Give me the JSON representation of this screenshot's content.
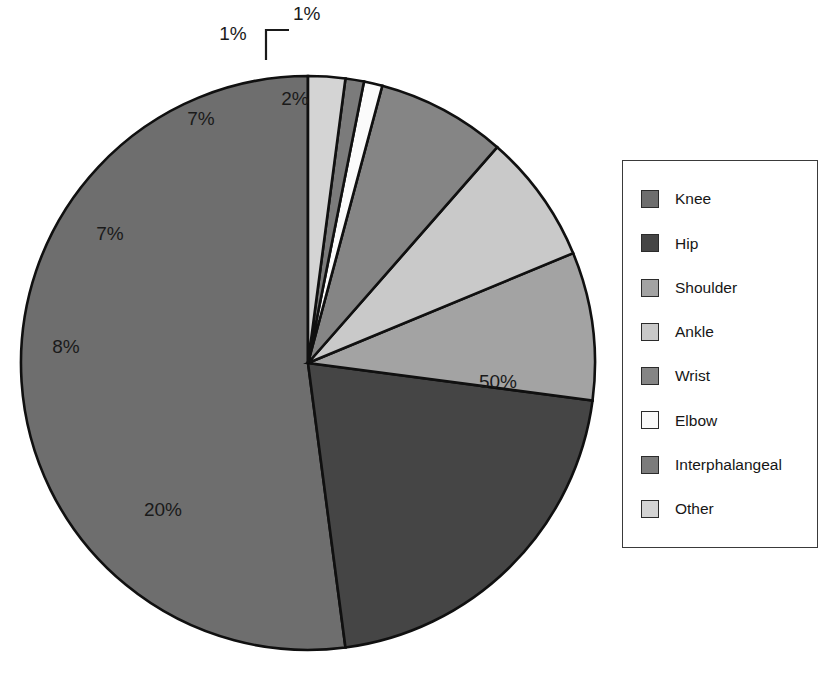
{
  "chart_data": {
    "type": "pie",
    "title": "",
    "subtitle": "",
    "xlabel": "",
    "ylabel": "",
    "grid": false,
    "legend_position": "right",
    "value_unit": "%",
    "categories": [
      "Knee",
      "Hip",
      "Shoulder",
      "Ankle",
      "Wrist",
      "Elbow",
      "Interphalangeal",
      "Other"
    ],
    "values": [
      50,
      20,
      8,
      7,
      7,
      1,
      1,
      2
    ],
    "labels": [
      "50%",
      "20%",
      "8%",
      "7%",
      "7%",
      "1%",
      "1%",
      "2%"
    ],
    "colors": [
      "#6e6e6e",
      "#454545",
      "#a3a3a3",
      "#c9c9c9",
      "#858585",
      "#fbfbfb",
      "#7b7b7b",
      "#d4d4d4"
    ],
    "slices": [
      {
        "name": "Knee",
        "value": 50,
        "label": "50%",
        "color": "#6e6e6e",
        "label_color": "#ffffff",
        "label_x": 498,
        "label_y": 388,
        "label_anchor": "middle"
      },
      {
        "name": "Hip",
        "value": 20,
        "label": "20%",
        "color": "#454545",
        "label_color": "#ffffff",
        "label_x": 163,
        "label_y": 516,
        "label_anchor": "middle"
      },
      {
        "name": "Shoulder",
        "value": 8,
        "label": "8%",
        "color": "#a3a3a3",
        "label_color": "#1a1a1a",
        "label_x": 66,
        "label_y": 353,
        "label_anchor": "middle"
      },
      {
        "name": "Ankle",
        "value": 7,
        "label": "7%",
        "color": "#c9c9c9",
        "label_color": "#1a1a1a",
        "label_x": 110,
        "label_y": 240,
        "label_anchor": "middle"
      },
      {
        "name": "Wrist",
        "value": 7,
        "label": "7%",
        "color": "#858585",
        "label_color": "#1a1a1a",
        "label_x": 201,
        "label_y": 125,
        "label_anchor": "middle"
      },
      {
        "name": "Elbow",
        "value": 1,
        "label": "1%",
        "color": "#fbfbfb",
        "label_color": "#1a1a1a",
        "label_x": 233,
        "label_y": 40,
        "label_anchor": "middle"
      },
      {
        "name": "Interphalangeal",
        "value": 1,
        "label": "1%",
        "color": "#7b7b7b",
        "label_color": "#1a1a1a",
        "label_x": 293,
        "label_y": 20,
        "label_anchor": "start"
      },
      {
        "name": "Other",
        "value": 2,
        "label": "2%",
        "color": "#d4d4d4",
        "label_color": "#1a1a1a",
        "label_x": 295,
        "label_y": 105,
        "label_anchor": "middle"
      }
    ],
    "geometry": {
      "center_x": 308,
      "center_y": 363,
      "radius": 287,
      "start_angle_deg": -90,
      "direction": "counterclockwise"
    },
    "leader_lines": [
      {
        "for": "Interphalangeal",
        "points": "266,60 266,30 289,30"
      }
    ]
  },
  "legend": {
    "border_color": "#3a3a3a",
    "items": [
      {
        "label": "Knee",
        "color": "#6e6e6e"
      },
      {
        "label": "Hip",
        "color": "#454545"
      },
      {
        "label": "Shoulder",
        "color": "#a3a3a3"
      },
      {
        "label": "Ankle",
        "color": "#c9c9c9"
      },
      {
        "label": "Wrist",
        "color": "#858585"
      },
      {
        "label": "Elbow",
        "color": "#fbfbfb"
      },
      {
        "label": "Interphalangeal",
        "color": "#7b7b7b"
      },
      {
        "label": "Other",
        "color": "#d4d4d4"
      }
    ]
  }
}
